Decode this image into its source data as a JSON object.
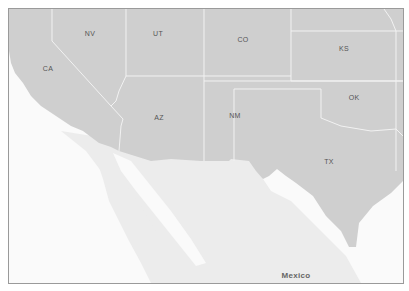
{
  "map": {
    "colors": {
      "us_fill": "#cfcfcf",
      "mexico_fill": "#ededed",
      "water": "#fafafa",
      "borders": "#f2f2f2",
      "frame": "#9a9a9a",
      "label": "#555555"
    },
    "states": [
      {
        "abbr": "NV",
        "x": 89,
        "y": 32
      },
      {
        "abbr": "UT",
        "x": 157,
        "y": 32
      },
      {
        "abbr": "CO",
        "x": 242,
        "y": 38
      },
      {
        "abbr": "KS",
        "x": 343,
        "y": 47
      },
      {
        "abbr": "CA",
        "x": 47,
        "y": 67
      },
      {
        "abbr": "OK",
        "x": 353,
        "y": 96
      },
      {
        "abbr": "AZ",
        "x": 158,
        "y": 116
      },
      {
        "abbr": "NM",
        "x": 234,
        "y": 114
      },
      {
        "abbr": "TX",
        "x": 328,
        "y": 160
      }
    ],
    "country_labels": [
      {
        "name": "Mexico",
        "x": 295,
        "y": 274
      }
    ]
  }
}
